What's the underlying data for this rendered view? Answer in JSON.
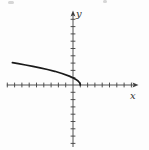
{
  "figure": {
    "background": "#fdfdfd",
    "axis_color": "#3f3f3f",
    "curve_color": "#1a1a1a",
    "label_color": "#333333"
  },
  "chart_data": {
    "type": "line",
    "title": "",
    "xlabel": "x",
    "ylabel": "y",
    "grid": false,
    "legend": false,
    "axes": {
      "x_ticks_min": -9,
      "x_ticks_max": 8,
      "y_ticks_min": -8,
      "y_ticks_max": 9,
      "tick_step": 1,
      "arrows": [
        "+x",
        "+y"
      ]
    },
    "series": [
      {
        "name": "sqrt-curve",
        "function": "y = sqrt(1 - x)",
        "x_start": -8.3,
        "x_end": 1,
        "points": [
          [
            -8.3,
            3.05
          ],
          [
            -7.5,
            2.92
          ],
          [
            -6.5,
            2.74
          ],
          [
            -5.5,
            2.55
          ],
          [
            -4.5,
            2.35
          ],
          [
            -3.5,
            2.12
          ],
          [
            -2.5,
            1.87
          ],
          [
            -1.5,
            1.58
          ],
          [
            -0.5,
            1.22
          ],
          [
            0,
            1.0
          ],
          [
            0.4,
            0.77
          ],
          [
            0.7,
            0.55
          ],
          [
            0.9,
            0.32
          ],
          [
            0.97,
            0.17
          ],
          [
            1,
            0
          ]
        ]
      }
    ]
  }
}
